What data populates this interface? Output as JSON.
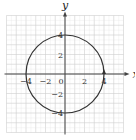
{
  "chart_data": {
    "type": "line",
    "title": "",
    "xlabel": "x",
    "ylabel": "y",
    "xlim": [
      -6,
      6
    ],
    "ylim": [
      -6,
      6
    ],
    "grid": true,
    "grid_minor": 0.5,
    "grid_major": 1,
    "x_ticks": [
      {
        "value": -4,
        "label": "−4"
      },
      {
        "value": -2,
        "label": "−2"
      },
      {
        "value": 0,
        "label": "0"
      },
      {
        "value": 2,
        "label": "2"
      },
      {
        "value": 4,
        "label": "4"
      }
    ],
    "y_ticks": [
      {
        "value": 4,
        "label": "4"
      },
      {
        "value": 2,
        "label": "2"
      },
      {
        "value": -2,
        "label": "−2"
      },
      {
        "value": -4,
        "label": "−4"
      }
    ],
    "series": [
      {
        "name": "circle",
        "equation": "x^2 + y^2 = 16",
        "center": [
          0,
          0
        ],
        "radius": 4,
        "orientation": "counterclockwise",
        "arrow_at": [
          4,
          0
        ],
        "color": "#333333"
      }
    ],
    "colors": {
      "curve": "#333333",
      "axis": "#444444",
      "grid_major": "#cfcfcf",
      "grid_minor": "#e2e2e2"
    }
  }
}
